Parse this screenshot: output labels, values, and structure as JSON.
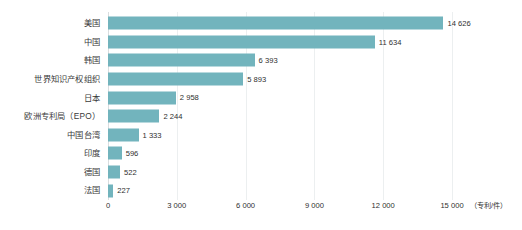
{
  "chart_data": {
    "type": "bar",
    "orientation": "horizontal",
    "title": "",
    "subtitle": "",
    "xlabel": "（专利/件）",
    "ylabel": "",
    "categories": [
      "美国",
      "中国",
      "韩国",
      "世界知识产权组织",
      "日本",
      "欧洲专利局（EPO）",
      "中国台湾",
      "印度",
      "德国",
      "法国"
    ],
    "values": [
      14626,
      11634,
      6393,
      5893,
      2958,
      2244,
      1333,
      596,
      522,
      227
    ],
    "value_labels": [
      "14 626",
      "11 634",
      "6 393",
      "5 893",
      "2 958",
      "2 244",
      "1 333",
      "596",
      "522",
      "227"
    ],
    "xlim": [
      0,
      15000
    ],
    "xticks": [
      0,
      3000,
      6000,
      9000,
      12000,
      15000
    ],
    "xtick_labels": [
      "0",
      "3 000",
      "6 000",
      "9 000",
      "12 000",
      "15 000"
    ],
    "grid": true,
    "legend": null,
    "series": [
      {
        "name": "专利数量",
        "values": [
          14626,
          11634,
          6393,
          5893,
          2958,
          2244,
          1333,
          596,
          522,
          227
        ]
      }
    ],
    "colors": {
      "bar": "#72b4bd",
      "background": "#ffffff",
      "gridline": "#eceff0",
      "axis_text": "#2f2f2f",
      "category_text": "#3a3a3a"
    }
  }
}
